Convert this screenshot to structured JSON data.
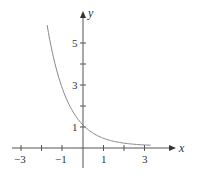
{
  "chart_data": {
    "type": "line",
    "title": "",
    "xlabel": "x",
    "ylabel": "y",
    "xlim": [
      -3,
      3.5
    ],
    "ylim": [
      0,
      6.5
    ],
    "x_ticks": [
      -3,
      -2,
      -1,
      0,
      1,
      2,
      3
    ],
    "x_tick_labels": [
      "-3",
      "",
      "-1",
      "",
      "1",
      "",
      "3"
    ],
    "y_ticks": [
      1,
      2,
      3,
      4,
      5
    ],
    "y_tick_labels": [
      "1",
      "",
      "3",
      "",
      "5"
    ],
    "grid": false,
    "legend": null,
    "series": [
      {
        "name": "y = e^(-x)",
        "x": [
          -1.75,
          -1.5,
          -1.0,
          -0.5,
          0,
          0.5,
          1.0,
          1.5,
          2.0,
          2.5,
          3.0,
          3.3
        ],
        "y": [
          5.75,
          4.48,
          2.72,
          1.65,
          1.0,
          0.61,
          0.37,
          0.22,
          0.14,
          0.08,
          0.05,
          0.04
        ]
      }
    ],
    "color": "#888888"
  },
  "labels": {
    "x_axis": "x",
    "y_axis": "y",
    "xt_m3": "−3",
    "xt_m1": "−1",
    "xt_1": "1",
    "xt_3": "3",
    "yt_1": "1",
    "yt_3": "3",
    "yt_5": "5"
  }
}
